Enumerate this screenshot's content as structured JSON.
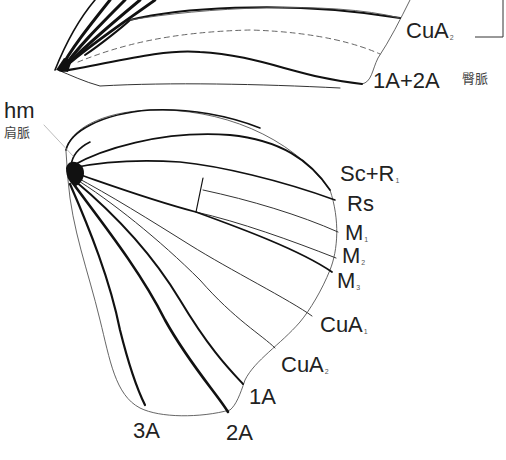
{
  "figure": {
    "forewing": {
      "labels": [
        {
          "id": "cua2",
          "main": "CuA",
          "sub": "2"
        },
        {
          "id": "1a2a",
          "main": "1A+2A",
          "sub": ""
        }
      ],
      "annotation": {
        "text": "臀脈"
      }
    },
    "hindwing": {
      "humeral": {
        "main": "hm",
        "sub_text": "肩脈"
      },
      "labels": [
        {
          "id": "scr1",
          "main": "Sc+R",
          "sub": "1"
        },
        {
          "id": "rs",
          "main": "Rs",
          "sub": ""
        },
        {
          "id": "m1",
          "main": "M",
          "sub": "1"
        },
        {
          "id": "m2",
          "main": "M",
          "sub": "2"
        },
        {
          "id": "m3",
          "main": "M",
          "sub": "3"
        },
        {
          "id": "cua1",
          "main": "CuA",
          "sub": "1"
        },
        {
          "id": "cua2",
          "main": "CuA",
          "sub": "2"
        },
        {
          "id": "1a",
          "main": "1A",
          "sub": ""
        },
        {
          "id": "2a",
          "main": "2A",
          "sub": ""
        },
        {
          "id": "3a",
          "main": "3A",
          "sub": ""
        }
      ]
    },
    "colors": {
      "vein": "#111111",
      "outline": "#333333",
      "text": "#222222",
      "leader": "#aaaaaa"
    }
  }
}
